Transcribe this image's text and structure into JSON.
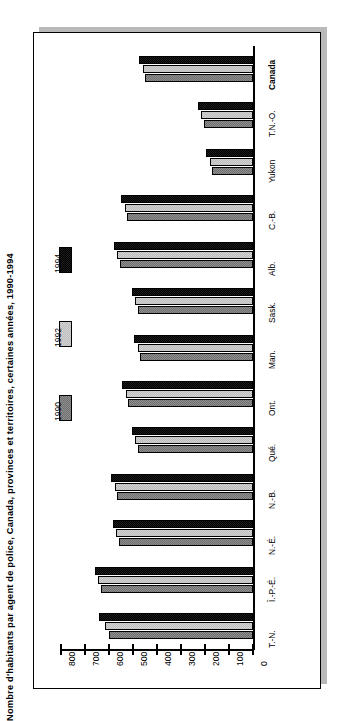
{
  "chart_data": {
    "type": "bar",
    "orientation": "horizontal-rotated",
    "title": "Nombre d'habitants par agent de police, Canada, provinces et territoires, certaines années, 1990-1994",
    "xlabel": "",
    "ylabel": "",
    "categories": [
      "T.-N.",
      "Î.-P.-É.",
      "N.-É.",
      "N.-B.",
      "Qué.",
      "Ont.",
      "Man.",
      "Sask.",
      "Alb.",
      "C.-B.",
      "Yukon",
      "T.N.-O.",
      "Canada"
    ],
    "series": [
      {
        "name": "1990",
        "color": "#8e8e8e",
        "values": [
          600,
          635,
          560,
          565,
          480,
          520,
          470,
          480,
          555,
          525,
          170,
          205,
          450
        ]
      },
      {
        "name": "1992",
        "color": "#d2d2d2",
        "values": [
          615,
          645,
          570,
          575,
          490,
          530,
          480,
          490,
          565,
          535,
          180,
          215,
          460
        ]
      },
      {
        "name": "1994",
        "color": "#1d1d1d",
        "values": [
          640,
          660,
          585,
          590,
          505,
          545,
          495,
          505,
          580,
          550,
          195,
          230,
          475
        ]
      }
    ],
    "axis_ticks": [
      0,
      100,
      200,
      300,
      400,
      500,
      600,
      700,
      800
    ],
    "axis_tick_labels": [
      "0",
      "100",
      "200",
      "300",
      "400",
      "500",
      "600",
      "700",
      "800"
    ],
    "xlim": [
      0,
      800
    ],
    "grid": false,
    "legend_position": "left-middle",
    "legend_entries": [
      "1990",
      "1992",
      "1994"
    ]
  },
  "figure": {
    "background_color": "#ffffff",
    "frame_border_color": "#000000",
    "shadow_color": "#b9b9b9"
  }
}
